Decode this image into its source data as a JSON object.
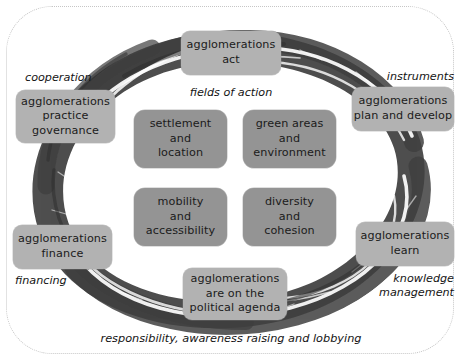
{
  "diagram": {
    "title_caption": "responsibility, awareness raising and lobbying",
    "center_group_label": "fields of action",
    "colors": {
      "outer_box": "#b2b2b2",
      "inner_box": "#949494",
      "ring": "#4a4a4a",
      "frame_border": "#c6c6c6",
      "text": "#1b1b1b",
      "background": "#ffffff"
    },
    "outer_nodes": [
      {
        "id": "act",
        "label": "agglomerations\nact",
        "caption": "fields of action",
        "caption_pos": "below-center"
      },
      {
        "id": "plan-develop",
        "label": "agglomerations\nplan and develop",
        "caption": "instruments",
        "caption_pos": "above-right"
      },
      {
        "id": "learn",
        "label": "agglomerations\nlearn",
        "caption": "knowledge\nmanagement",
        "caption_pos": "below-right"
      },
      {
        "id": "political",
        "label": "agglomerations\nare on the\npolitical agenda",
        "caption": "",
        "caption_pos": "none"
      },
      {
        "id": "finance",
        "label": "agglomerations\nfinance",
        "caption": "financing",
        "caption_pos": "below-left"
      },
      {
        "id": "governance",
        "label": "agglomerations\npractice\ngovernance",
        "caption": "cooperation",
        "caption_pos": "above-left"
      }
    ],
    "inner_nodes": [
      {
        "id": "settlement",
        "label": "settlement\nand\nlocation"
      },
      {
        "id": "green",
        "label": "green areas\nand environment"
      },
      {
        "id": "mobility",
        "label": "mobility\nand\naccessibility"
      },
      {
        "id": "diversity",
        "label": "diversity\nand\ncohesion"
      }
    ]
  }
}
